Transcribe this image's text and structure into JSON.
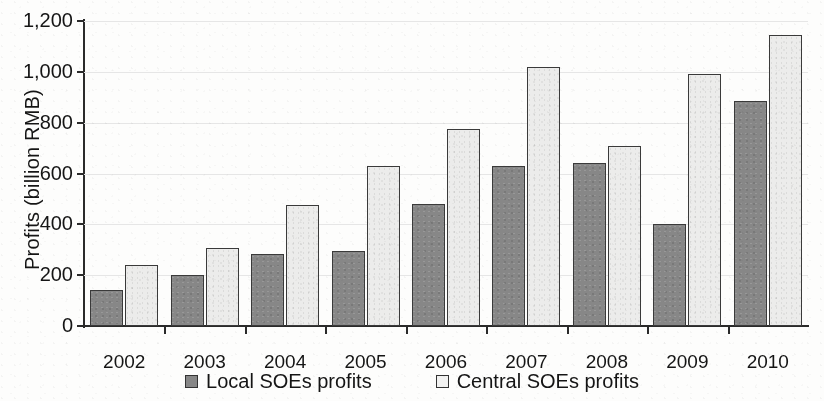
{
  "chart_data": {
    "type": "bar",
    "title": "",
    "xlabel": "",
    "ylabel": "Profits (billion RMB)",
    "categories": [
      "2002",
      "2003",
      "2004",
      "2005",
      "2006",
      "2007",
      "2008",
      "2009",
      "2010"
    ],
    "series": [
      {
        "name": "Local SOEs profits",
        "color": "#878787",
        "values": [
          140,
          200,
          285,
          295,
          480,
          630,
          640,
          400,
          885
        ]
      },
      {
        "name": "Central SOEs profits",
        "color": "#ececeb",
        "values": [
          240,
          305,
          475,
          630,
          775,
          1020,
          710,
          990,
          1145
        ]
      }
    ],
    "ylim": [
      0,
      1200
    ],
    "yticks": [
      0,
      200,
      400,
      600,
      800,
      1000,
      1200
    ],
    "ytick_labels": [
      "0",
      "200",
      "400",
      "600",
      "800",
      "1,000",
      "1,200"
    ],
    "grid": true,
    "legend_position": "bottom"
  },
  "legend": {
    "items": [
      {
        "label": "Local SOEs profits",
        "swatch": "dark-gray-square"
      },
      {
        "label": "Central SOEs profits",
        "swatch": "light-gray-square"
      }
    ]
  }
}
